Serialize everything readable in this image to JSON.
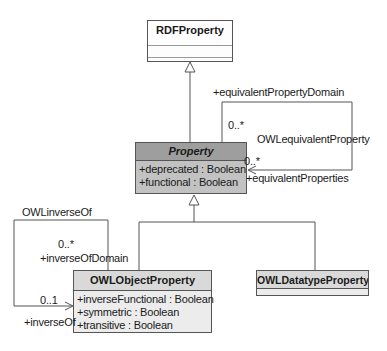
{
  "diagram": {
    "classes": {
      "rdf_property": {
        "name": "RDFProperty",
        "attributes": []
      },
      "property": {
        "name": "Property",
        "abstract": true,
        "attributes": [
          "+deprecated : Boolean",
          "+functional : Boolean"
        ]
      },
      "owl_object_property": {
        "name": "OWLObjectProperty",
        "attributes": [
          "+inverseFunctional : Boolean",
          "+symmetric : Boolean",
          "+transitive : Boolean"
        ]
      },
      "owl_datatype_property": {
        "name": "OWLDatatypeProperty",
        "attributes": []
      }
    },
    "associations": {
      "equivalent": {
        "name": "OWLequivalentProperty",
        "domain_role": "+equivalentPropertyDomain",
        "domain_multiplicity": "0..*",
        "range_role": "+equivalentProperties",
        "range_multiplicity": "0..*"
      },
      "inverse": {
        "name": "OWLinverseOf",
        "domain_role": "+inverseOfDomain",
        "domain_multiplicity": "0..*",
        "range_role": "+inverseOf",
        "range_multiplicity": "0..1"
      }
    },
    "colors": {
      "abstract_header_fill": "#9e9e9e",
      "abstract_body_fill": "#c2c2c2",
      "class_header_fill": "#d9d9d9",
      "class_body_fill": "#ececec",
      "plain_class_fill": "#fdfdfd",
      "line_color": "#555555",
      "background": "#ffffff"
    }
  }
}
